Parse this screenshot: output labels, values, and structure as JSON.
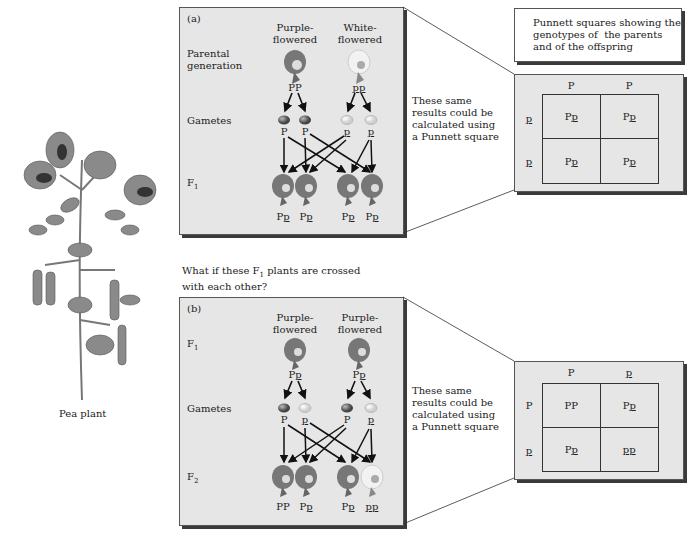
{
  "plant": {
    "label": "Pea plant"
  },
  "panel_a": {
    "tag": "(a)",
    "col1": "Purple-\nflowered",
    "col2": "White-\nflowered",
    "row_parental": "Parental\ngeneration",
    "row_gametes": "Gametes",
    "row_f1": "F",
    "row_f1_sub": "1",
    "parent1_genotype": "PP",
    "parent2_genotype": "pp",
    "gametes": [
      "P",
      "P",
      "p",
      "p"
    ],
    "offspring": [
      "Pp",
      "Pp",
      "Pp",
      "Pp"
    ]
  },
  "panel_b": {
    "tag": "(b)",
    "col1": "Purple-\nflowered",
    "col2": "Purple-\nflowered",
    "row_f1": "F",
    "row_f1_sub": "1",
    "row_gametes": "Gametes",
    "row_f2": "F",
    "row_f2_sub": "2",
    "parent1_genotype": "Pp",
    "parent2_genotype": "Pp",
    "gametes": [
      "P",
      "p",
      "P",
      "p"
    ],
    "offspring": [
      "PP",
      "Pp",
      "Pp",
      "pp"
    ]
  },
  "question": {
    "line1": "What if these F",
    "sub": "1",
    "line1_end": " plants are crossed",
    "line2": "with each other?"
  },
  "side_text_a": "These same\nresults could be\ncalculated using\na Punnett square",
  "side_text_b": "These same\nresults could be\ncalculated using\na Punnett square",
  "caption": "Punnett squares showing the\ngenotypes of  the parents\nand of the offspring",
  "punnett_a": {
    "top": [
      "P",
      "P"
    ],
    "left": [
      "p",
      "p"
    ],
    "cells": [
      "Pp",
      "Pp",
      "Pp",
      "Pp"
    ]
  },
  "punnett_b": {
    "top": [
      "P",
      "p"
    ],
    "left": [
      "P",
      "p"
    ],
    "cells": [
      "PP",
      "Pp",
      "Pp",
      "pp"
    ]
  },
  "colors": {
    "panel_bg": "#e6e6e6",
    "purple_flower": "#6b6b6b",
    "white_flower": "#f2f2f2"
  }
}
